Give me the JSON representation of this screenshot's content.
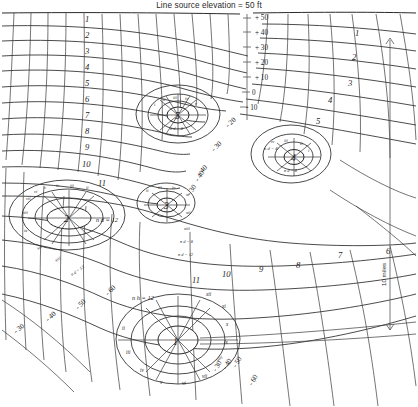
{
  "title": "Line source elevation = 50 ft",
  "figure": {
    "type": "flow-net"
  },
  "elevation_axis": {
    "label": "elevation",
    "ticks": [
      "+ 50",
      "+ 40",
      "+ 30",
      "+ 20",
      "+ 10",
      "0",
      "- 10",
      "- 20",
      "- 30",
      "- 40"
    ]
  },
  "contours_left": [
    "- 30",
    "- 40",
    "- 50",
    "- 60"
  ],
  "contours_bottom": [
    "- 60",
    "- 50",
    "- 40",
    "- 30"
  ],
  "scale_bar": {
    "label": "10 miles"
  },
  "wells": [
    {
      "id": "1",
      "nd_label": "n h = 12"
    },
    {
      "id": "2",
      "nd_label": "n d = 13"
    },
    {
      "id": "3",
      "nd_label": "n d = 12"
    },
    {
      "id": "4",
      "nd_label": "n d = 8"
    },
    {
      "id": "5",
      "nd_label": "n d = 8"
    }
  ],
  "nd_labels": [
    {
      "text": "n h = 12"
    },
    {
      "text": "n d = 13"
    },
    {
      "text": "n d = 12"
    },
    {
      "text": "n d = 8"
    },
    {
      "text": "n d = 4"
    }
  ],
  "equipotential_left": [
    "1",
    "2",
    "3",
    "4",
    "5",
    "6",
    "7",
    "8",
    "9",
    "10",
    "11"
  ],
  "equipotential_right": [
    "1",
    "2",
    "3",
    "4",
    "5",
    "6",
    "7",
    "8",
    "9",
    "10",
    "11"
  ],
  "equipotential_lower": [
    "8",
    "9",
    "10",
    "11"
  ],
  "roman_numerals": [
    "i",
    "ii",
    "iii",
    "iv",
    "v",
    "vi",
    "vii",
    "viii",
    "ix",
    "x",
    "xi",
    "xii",
    "xiii"
  ],
  "colors": {
    "ink": "#232323",
    "grid": "#2b2b2b",
    "background": "#ffffff"
  }
}
